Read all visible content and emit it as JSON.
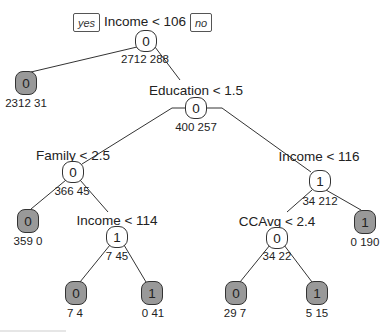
{
  "tree": {
    "branch_labels": {
      "yes": "yes",
      "no": "no"
    },
    "edge_color": "#333333",
    "leaf_fill": "#999999",
    "node_fill": "#ffffff",
    "nodes": {
      "root": {
        "split": "Income < 106",
        "class": "0",
        "counts": "2712 288"
      },
      "leaf_a": {
        "class": "0",
        "counts": "2312 31"
      },
      "education": {
        "split": "Education < 1.5",
        "class": "0",
        "counts": "400 257"
      },
      "family": {
        "split": "Family < 2.5",
        "class": "0",
        "counts": "366 45"
      },
      "leaf_b": {
        "class": "0",
        "counts": "359 0"
      },
      "income114": {
        "split": "Income < 114",
        "class": "1",
        "counts": "7 45"
      },
      "leaf_c": {
        "class": "0",
        "counts": "7 4"
      },
      "leaf_d": {
        "class": "1",
        "counts": "0 41"
      },
      "income116": {
        "split": "Income < 116",
        "class": "1",
        "counts": "34 212"
      },
      "ccavg": {
        "split": "CCAvg < 2.4",
        "class": "0",
        "counts": "34 22"
      },
      "leaf_e": {
        "class": "0",
        "counts": "29 7"
      },
      "leaf_f": {
        "class": "1",
        "counts": "5 15"
      },
      "leaf_g": {
        "class": "1",
        "counts": "0 190"
      }
    }
  }
}
